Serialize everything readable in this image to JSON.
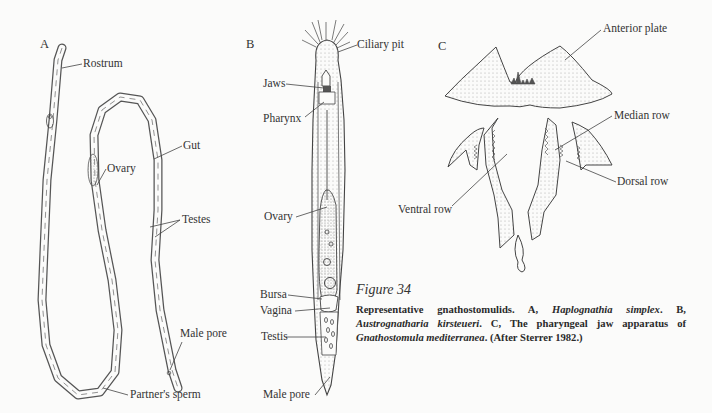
{
  "figure": {
    "title": "Figure 34",
    "caption": {
      "intro": "Representative gnathostomulids.",
      "a_label": "A,",
      "a_species": "Haplognathia simplex",
      "b_label": "B,",
      "b_species": "Austrognatharia kirsteueri",
      "c_label": "C, The pharyngeal jaw apparatus of",
      "c_species": "Gnathostomula mediterranea",
      "source": "(After Sterrer 1982.)"
    }
  },
  "panels": {
    "a": {
      "letter": "A",
      "labels": [
        "Rostrum",
        "Gut",
        "Ovary",
        "Testes",
        "Male pore",
        "Partner's sperm"
      ]
    },
    "b": {
      "letter": "B",
      "labels": [
        "Ciliary pit",
        "Jaws",
        "Pharynx",
        "Ovary",
        "Bursa",
        "Vagina",
        "Testis",
        "Male pore"
      ]
    },
    "c": {
      "letter": "C",
      "labels": [
        "Anterior plate",
        "Median row",
        "Dorsal row",
        "Ventral row"
      ]
    }
  }
}
